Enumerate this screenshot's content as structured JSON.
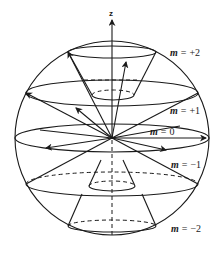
{
  "diagram": {
    "type": "vector-model-angular-momentum",
    "axis_label": "z",
    "levels": [
      {
        "m_symbol": "m",
        "eq": "=",
        "value": "+2"
      },
      {
        "m_symbol": "m",
        "eq": "=",
        "value": "+1"
      },
      {
        "m_symbol": "m",
        "eq": "=",
        "value": "0"
      },
      {
        "m_symbol": "m",
        "eq": "=",
        "value": "−1"
      },
      {
        "m_symbol": "m",
        "eq": "=",
        "value": "−2"
      }
    ],
    "colors": {
      "line": "#1a1a1a",
      "background": "#ffffff"
    }
  }
}
